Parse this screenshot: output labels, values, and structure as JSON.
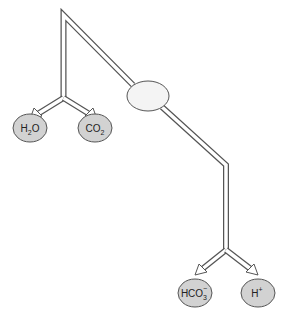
{
  "diagram": {
    "center_node": {
      "label": ""
    },
    "left_products": [
      {
        "base": "H",
        "sub": "2",
        "tail": "O",
        "sup": ""
      },
      {
        "base": "CO",
        "sub": "2",
        "tail": "",
        "sup": ""
      }
    ],
    "right_products": [
      {
        "base": "HCO",
        "sub": "3",
        "tail": "",
        "sup": "−"
      },
      {
        "base": "H",
        "sub": "",
        "tail": "",
        "sup": "+"
      }
    ],
    "colors": {
      "line": "#555555",
      "product_fill": "#d2d2d2",
      "center_fill": "#f4f4f4"
    }
  }
}
